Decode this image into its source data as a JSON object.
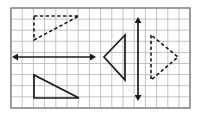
{
  "figure": {
    "background_color": "#ffffff",
    "grid": {
      "line_color": "#b4b4b4",
      "border_color": "#8c8c8c",
      "cell_size": 11.2,
      "columns": 16,
      "rows": 9,
      "x0": 11,
      "y0": 8,
      "x1": 190,
      "y1": 108
    },
    "stroke_color": "#1a1a1a",
    "left_group": {
      "name": "horizontal-reflection",
      "mirror_line": {
        "name": "horizontal-line-of-reflection",
        "style": "solid",
        "arrowheads": "both",
        "x1": 18,
        "y1": 57,
        "x2": 90,
        "y2": 57
      },
      "pre_image": {
        "name": "dashed-triangle-above",
        "style": "dashed",
        "points": "34,16 79,16 34,40",
        "right_angle_at": "top-left"
      },
      "image": {
        "name": "solid-triangle-below",
        "style": "solid",
        "points": "34,75 34,98 79,98",
        "right_angle_at": "bottom-left"
      }
    },
    "right_group": {
      "name": "vertical-reflection",
      "mirror_line": {
        "name": "vertical-line-of-reflection",
        "style": "solid",
        "arrowheads": "both",
        "x1": 138,
        "y1": 23,
        "x2": 138,
        "y2": 95
      },
      "pre_image": {
        "name": "solid-triangle-left",
        "style": "solid",
        "points": "125,35 125,80 104,57",
        "apex_direction": "left"
      },
      "image": {
        "name": "dashed-triangle-right",
        "style": "dashed",
        "points": "151,35 151,80 178,57",
        "apex_direction": "right"
      }
    }
  }
}
